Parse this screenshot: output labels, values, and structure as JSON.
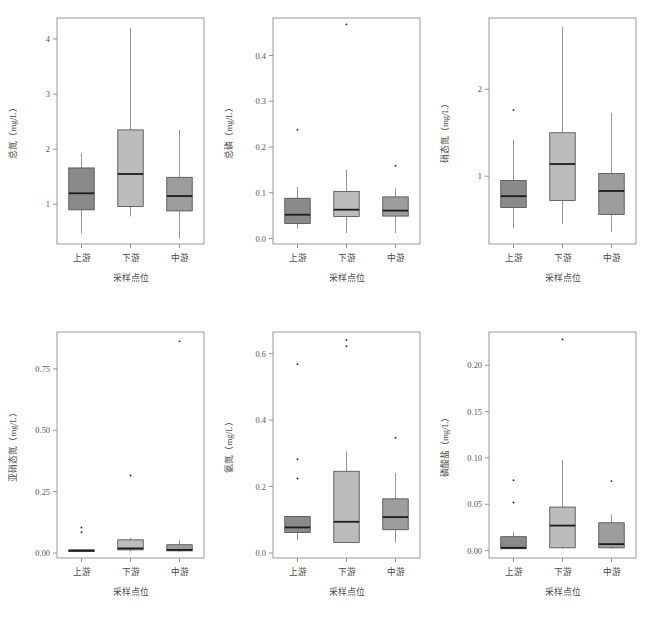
{
  "figure": {
    "background": "#ffffff",
    "panel_border_color": "#8f8f8f",
    "axis_color": "#8a8a8a",
    "text_color": "#555555"
  },
  "categories": [
    "上游",
    "下游",
    "中游"
  ],
  "xlabel": "采样点位",
  "box_colors": {
    "upstream": "#8a8a8a",
    "downstream": "#bcbcbc",
    "midstream": "#9d9d9d",
    "median_line": "#1c1c1c",
    "box_edge": "#4a4a4a",
    "whisker": "#8a8a8a",
    "outlier": "#2a2a2a"
  },
  "chart_data": [
    {
      "id": "panel-total-nitrogen",
      "type": "box",
      "title": "",
      "xlabel": "采样点位",
      "ylabel": "总氮（mg/L）",
      "categories": [
        "上游",
        "下游",
        "中游"
      ],
      "yticks": [
        1,
        2,
        3,
        4
      ],
      "ytick_labels": [
        "1",
        "2",
        "3",
        "4"
      ],
      "ylim": [
        0.28,
        4.38
      ],
      "boxes": [
        {
          "category": "上游",
          "min": 0.47,
          "q1": 0.9,
          "median": 1.2,
          "q3": 1.66,
          "max": 1.93,
          "outliers": []
        },
        {
          "category": "下游",
          "min": 0.78,
          "q1": 0.96,
          "median": 1.55,
          "q3": 2.35,
          "max": 4.2,
          "outliers": []
        },
        {
          "category": "中游",
          "min": 0.38,
          "q1": 0.88,
          "median": 1.15,
          "q3": 1.49,
          "max": 2.35,
          "outliers": []
        }
      ]
    },
    {
      "id": "panel-total-phosphorus",
      "type": "box",
      "title": "",
      "xlabel": "采样点位",
      "ylabel": "总磷（mg/L）",
      "categories": [
        "上游",
        "下游",
        "中游"
      ],
      "yticks": [
        0.0,
        0.1,
        0.2,
        0.3,
        0.4
      ],
      "ytick_labels": [
        "0.0",
        "0.1",
        "0.2",
        "0.3",
        "0.4"
      ],
      "ylim": [
        -0.012,
        0.482
      ],
      "boxes": [
        {
          "category": "上游",
          "min": 0.021,
          "q1": 0.033,
          "median": 0.052,
          "q3": 0.088,
          "max": 0.113,
          "outliers": [
            0.238
          ]
        },
        {
          "category": "下游",
          "min": 0.012,
          "q1": 0.048,
          "median": 0.063,
          "q3": 0.103,
          "max": 0.15,
          "outliers": [
            0.468
          ]
        },
        {
          "category": "中游",
          "min": 0.012,
          "q1": 0.049,
          "median": 0.061,
          "q3": 0.091,
          "max": 0.111,
          "outliers": [
            0.159
          ]
        }
      ]
    },
    {
      "id": "panel-nitrate-nitrogen",
      "type": "box",
      "title": "",
      "xlabel": "采样点位",
      "ylabel": "硝态氮（mg/L）",
      "categories": [
        "上游",
        "下游",
        "中游"
      ],
      "yticks": [
        1,
        2
      ],
      "ytick_labels": [
        "1",
        "2"
      ],
      "ylim": [
        0.22,
        2.82
      ],
      "boxes": [
        {
          "category": "上游",
          "min": 0.4,
          "q1": 0.64,
          "median": 0.77,
          "q3": 0.95,
          "max": 1.42,
          "outliers": [
            1.76
          ]
        },
        {
          "category": "下游",
          "min": 0.45,
          "q1": 0.72,
          "median": 1.14,
          "q3": 1.5,
          "max": 2.72,
          "outliers": []
        },
        {
          "category": "中游",
          "min": 0.36,
          "q1": 0.56,
          "median": 0.83,
          "q3": 1.03,
          "max": 1.73,
          "outliers": []
        }
      ]
    },
    {
      "id": "panel-nitrite-nitrogen",
      "type": "box",
      "title": "",
      "xlabel": "采样点位",
      "ylabel": "亚硝态氮（mg/L）",
      "categories": [
        "上游",
        "下游",
        "中游"
      ],
      "yticks": [
        0.0,
        0.25,
        0.5,
        0.75
      ],
      "ytick_labels": [
        "0.00",
        "0.25",
        "0.50",
        "0.75"
      ],
      "ylim": [
        -0.02,
        0.9
      ],
      "boxes": [
        {
          "category": "上游",
          "min": 0.004,
          "q1": 0.006,
          "median": 0.01,
          "q3": 0.013,
          "max": 0.016,
          "outliers": [
            0.085,
            0.104
          ]
        },
        {
          "category": "下游",
          "min": 0.006,
          "q1": 0.013,
          "median": 0.019,
          "q3": 0.054,
          "max": 0.062,
          "outliers": [
            0.316
          ]
        },
        {
          "category": "中游",
          "min": 0.005,
          "q1": 0.009,
          "median": 0.013,
          "q3": 0.034,
          "max": 0.055,
          "outliers": [
            0.862
          ]
        }
      ]
    },
    {
      "id": "panel-ammonia-nitrogen",
      "type": "box",
      "title": "",
      "xlabel": "采样点位",
      "ylabel": "氨氮（mg/L）",
      "categories": [
        "上游",
        "下游",
        "中游"
      ],
      "yticks": [
        0.0,
        0.2,
        0.4,
        0.6
      ],
      "ytick_labels": [
        "0.0",
        "0.2",
        "0.4",
        "0.6"
      ],
      "ylim": [
        -0.015,
        0.665
      ],
      "boxes": [
        {
          "category": "上游",
          "min": 0.038,
          "q1": 0.062,
          "median": 0.077,
          "q3": 0.11,
          "max": 0.112,
          "outliers": [
            0.224,
            0.282,
            0.568
          ]
        },
        {
          "category": "下游",
          "min": 0.03,
          "q1": 0.032,
          "median": 0.094,
          "q3": 0.246,
          "max": 0.306,
          "outliers": [
            0.622,
            0.641
          ]
        },
        {
          "category": "中游",
          "min": 0.032,
          "q1": 0.07,
          "median": 0.108,
          "q3": 0.163,
          "max": 0.241,
          "outliers": [
            0.347
          ]
        }
      ]
    },
    {
      "id": "panel-phosphate",
      "type": "box",
      "title": "",
      "xlabel": "采样点位",
      "ylabel": "磷酸盐（mg/L）",
      "categories": [
        "上游",
        "下游",
        "中游"
      ],
      "yticks": [
        0.0,
        0.05,
        0.1,
        0.15,
        0.2
      ],
      "ytick_labels": [
        "0.00",
        "0.05",
        "0.10",
        "0.15",
        "0.20"
      ],
      "ylim": [
        -0.008,
        0.236
      ],
      "boxes": [
        {
          "category": "上游",
          "min": 0.002,
          "q1": 0.002,
          "median": 0.003,
          "q3": 0.015,
          "max": 0.02,
          "outliers": [
            0.052,
            0.076
          ]
        },
        {
          "category": "下游",
          "min": 0.002,
          "q1": 0.003,
          "median": 0.027,
          "q3": 0.047,
          "max": 0.098,
          "outliers": [
            0.228
          ]
        },
        {
          "category": "中游",
          "min": 0.002,
          "q1": 0.003,
          "median": 0.007,
          "q3": 0.03,
          "max": 0.039,
          "outliers": [
            0.075
          ]
        }
      ]
    }
  ]
}
